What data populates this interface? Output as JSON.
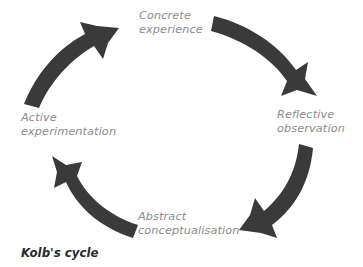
{
  "diagram": {
    "title": "Kolb's cycle",
    "caption": "Kolb's cycle",
    "type": "cycle",
    "direction": "clockwise",
    "label_color": "#8c8c8c",
    "arrow_color": "#3a3a3a",
    "caption_color": "#2c2c2c",
    "background_color": "#ffffff",
    "stages": [
      {
        "id": "concrete-experience",
        "position": "top",
        "line1": "Concrete",
        "line2": "experience"
      },
      {
        "id": "reflective-observation",
        "position": "right",
        "line1": "Reflective",
        "line2": "observation"
      },
      {
        "id": "abstract-conceptualisation",
        "position": "bottom",
        "line1": "Abstract",
        "line2": "conceptualisation"
      },
      {
        "id": "active-experimentation",
        "position": "left",
        "line1": "Active",
        "line2": "experimentation"
      }
    ],
    "arrows": [
      {
        "id": "arrow-concrete-to-reflective",
        "from": "concrete-experience",
        "to": "reflective-observation",
        "quadrant": "top-right"
      },
      {
        "id": "arrow-reflective-to-abstract",
        "from": "reflective-observation",
        "to": "abstract-conceptualisation",
        "quadrant": "bottom-right"
      },
      {
        "id": "arrow-abstract-to-active",
        "from": "abstract-conceptualisation",
        "to": "active-experimentation",
        "quadrant": "bottom-left"
      },
      {
        "id": "arrow-active-to-concrete",
        "from": "active-experimentation",
        "to": "concrete-experience",
        "quadrant": "top-left"
      }
    ]
  }
}
